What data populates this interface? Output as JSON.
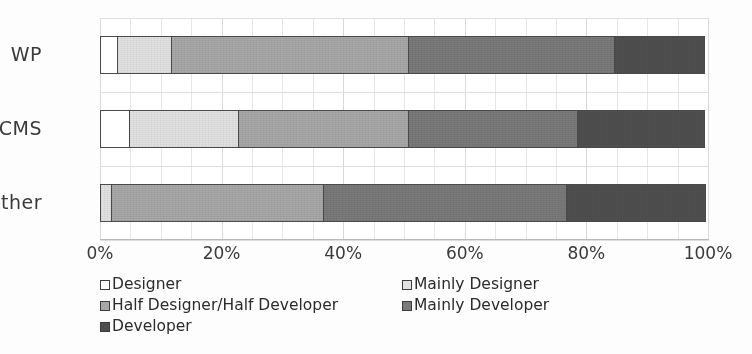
{
  "chart_data": {
    "type": "bar",
    "orientation": "horizontal",
    "stacked": true,
    "normalized": "100%",
    "title": "",
    "subtitle": "",
    "xlabel": "",
    "ylabel": "",
    "xlim": [
      0,
      100
    ],
    "xtick_labels": [
      "0%",
      "20%",
      "40%",
      "60%",
      "80%",
      "100%"
    ],
    "xtick_values": [
      0,
      20,
      40,
      60,
      80,
      100
    ],
    "grid": "vertical-major-and-minor",
    "legend_position": "bottom-left",
    "categories": [
      "WP",
      "CMS",
      "Other"
    ],
    "series": [
      {
        "name": "Designer",
        "color": "#ffffff",
        "values": [
          3,
          5,
          0
        ]
      },
      {
        "name": "Mainly Designer",
        "color": "#e2e2e2",
        "values": [
          9,
          18,
          2
        ]
      },
      {
        "name": "Half Designer/Half Developer",
        "color": "#a8a8a8",
        "values": [
          39,
          28,
          35
        ]
      },
      {
        "name": "Mainly Developer",
        "color": "#7a7a7a",
        "values": [
          34,
          28,
          40
        ]
      },
      {
        "name": "Developer",
        "color": "#4f4f4f",
        "values": [
          15,
          21,
          23
        ]
      }
    ]
  },
  "axis": {
    "y_categories": [
      "WP",
      "CMS",
      "Other"
    ],
    "x_ticks": [
      "0%",
      "20%",
      "40%",
      "60%",
      "80%",
      "100%"
    ]
  },
  "legend": {
    "rows": [
      [
        {
          "label": "Designer",
          "color": "#ffffff"
        },
        {
          "label": "Mainly Designer",
          "color": "#e2e2e2"
        }
      ],
      [
        {
          "label": "Half Designer/Half Developer",
          "color": "#a8a8a8"
        },
        {
          "label": "Mainly Developer",
          "color": "#7a7a7a"
        }
      ],
      [
        {
          "label": "Developer",
          "color": "#4f4f4f"
        }
      ]
    ]
  }
}
